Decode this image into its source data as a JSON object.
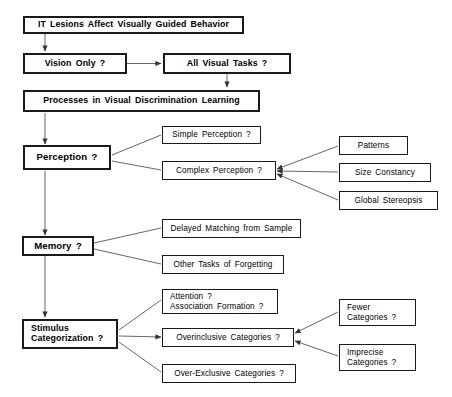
{
  "diagram": {
    "title": "IT Lesions Affect Visually Guided Behavior",
    "nodes": {
      "root": "IT Lesions Affect  Visually  Guided  Behavior",
      "vision_only": "Vision Only ?",
      "all_visual_tasks": "All  Visual  Tasks ?",
      "processes": "Processes in Visual  Discrimination  Learning",
      "perception": "Perception ?",
      "simple_perception": "Simple  Perception ?",
      "complex_perception": "Complex  Perception ?",
      "patterns": "Patterns",
      "size_constancy": "Size  Constancy",
      "global_stereopsis": "Global  Stereopsis",
      "memory": "Memory ?",
      "delayed_matching": "Delayed  Matching from Sample",
      "other_tasks": "Other Tasks of Forgetting",
      "stimulus_categorization": "Stimulus\nCategorization ?",
      "attention": "Attention ?\nAssociation  Formation ?",
      "overinclusive": "Overinclusive  Categories ?",
      "over_exclusive": "Over-Exclusive  Categories ?",
      "fewer_categories": "Fewer\nCategories ?",
      "imprecise_categories": "Imprecise\nCategories ?"
    },
    "colors": {
      "stroke": "#1a1a1a",
      "connector": "#555555",
      "background": "#ffffff",
      "text": "#000000"
    }
  }
}
